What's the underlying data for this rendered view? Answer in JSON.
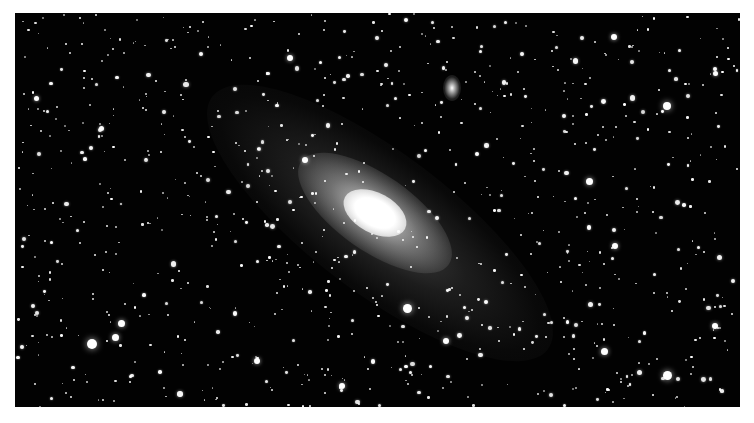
{
  "image": {
    "subject": "Andromeda Galaxy",
    "description": "Black-and-white astrophotograph of a large spiral galaxy with a bright core, tilted disk, and satellite galaxy, surrounded by a dense star field.",
    "colors": {
      "sky": "#020202",
      "star": "#ffffff",
      "frame": "#ffffff"
    }
  },
  "galaxy": {
    "core": {
      "x": 360,
      "y": 200,
      "rx": 34,
      "ry": 20,
      "angle": 28
    },
    "inner_disk": {
      "x": 360,
      "y": 200,
      "rx": 90,
      "ry": 38,
      "angle": 35
    },
    "outer_disk": {
      "x": 365,
      "y": 210,
      "rx": 210,
      "ry": 70,
      "angle": 37
    },
    "satellite": {
      "x": 437,
      "y": 75,
      "rx": 9,
      "ry": 13,
      "angle": 0
    }
  },
  "bright_stars": [
    {
      "x": 77,
      "y": 331,
      "r": 5
    },
    {
      "x": 100,
      "y": 324,
      "r": 3.5
    },
    {
      "x": 106,
      "y": 310,
      "r": 3.5
    },
    {
      "x": 392,
      "y": 295,
      "r": 4.5
    },
    {
      "x": 652,
      "y": 93,
      "r": 4
    },
    {
      "x": 574,
      "y": 168,
      "r": 3.5
    },
    {
      "x": 652,
      "y": 362,
      "r": 4.5
    },
    {
      "x": 589,
      "y": 338,
      "r": 3.5
    },
    {
      "x": 600,
      "y": 233,
      "r": 3
    },
    {
      "x": 599,
      "y": 24,
      "r": 3
    },
    {
      "x": 242,
      "y": 348,
      "r": 3
    },
    {
      "x": 327,
      "y": 373,
      "r": 3
    },
    {
      "x": 431,
      "y": 328,
      "r": 3
    },
    {
      "x": 290,
      "y": 147,
      "r": 3
    },
    {
      "x": 700,
      "y": 313,
      "r": 3
    },
    {
      "x": 21,
      "y": 85,
      "r": 2.5
    },
    {
      "x": 275,
      "y": 45,
      "r": 3
    },
    {
      "x": 700,
      "y": 60,
      "r": 2.5
    }
  ],
  "star_field": {
    "count": 900,
    "seed": 42
  }
}
